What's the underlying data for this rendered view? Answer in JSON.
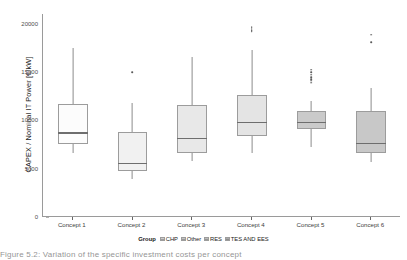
{
  "chart_data": {
    "type": "box",
    "title": "",
    "xlabel": "",
    "ylabel": "CAPEX / Nominal IT Power [€/kW]",
    "ylim": [
      0,
      21000
    ],
    "yticks": [
      0,
      5000,
      10000,
      15000,
      20000
    ],
    "ytick_labels": [
      "0",
      "5000",
      "10000",
      "15000",
      "20000"
    ],
    "grid": false,
    "legend_position": "bottom",
    "categories": [
      "Concept 1",
      "Concept 2",
      "Concept 3",
      "Concept 4",
      "Concept 5",
      "Concept 6"
    ],
    "legend_title": "Group",
    "legend_entries": [
      {
        "label": "CHP",
        "color": "#fdfdfd"
      },
      {
        "label": "Other",
        "color": "#efefef"
      },
      {
        "label": "RES",
        "color": "#e4e4e4"
      },
      {
        "label": "TES AND EES",
        "color": "#c9c9c9"
      }
    ],
    "boxes": [
      {
        "category": "Concept 1",
        "group": "CHP",
        "color": "#fcfcfc",
        "whisker_low": 6600,
        "q1": 7550,
        "median": 8700,
        "q3": 11650,
        "whisker_high": 17450,
        "outliers": []
      },
      {
        "category": "Concept 2",
        "group": "CHP",
        "color": "#f1f1f1",
        "whisker_low": 3950,
        "q1": 4750,
        "median": 5500,
        "q3": 8800,
        "whisker_high": 11750,
        "outliers": [
          14950
        ]
      },
      {
        "category": "Concept 3",
        "group": "Other",
        "color": "#e8e8e8",
        "whisker_low": 5800,
        "q1": 6650,
        "median": 8100,
        "q3": 11550,
        "whisker_high": 16600,
        "outliers": []
      },
      {
        "category": "Concept 4",
        "group": "RES",
        "color": "#e4e4e4",
        "whisker_low": 6600,
        "q1": 8350,
        "median": 9750,
        "q3": 12650,
        "whisker_high": 17250,
        "outliers": [
          19200,
          19350,
          19500,
          19650
        ]
      },
      {
        "category": "Concept 5",
        "group": "TES AND EES",
        "color": "#cacaca",
        "whisker_low": 7200,
        "q1": 9150,
        "median": 9800,
        "q3": 11000,
        "whisker_high": 12050,
        "outliers": [
          13900,
          14100,
          14250,
          14450,
          14700,
          14950,
          15250
        ]
      },
      {
        "category": "Concept 6",
        "group": "TES AND EES",
        "color": "#c8c8c8",
        "whisker_low": 5650,
        "q1": 6650,
        "median": 7600,
        "q3": 11000,
        "whisker_high": 13350,
        "outliers": [
          18100,
          18850
        ]
      }
    ]
  },
  "caption": "Figure 5.2: Variation of the specific investment costs per concept"
}
